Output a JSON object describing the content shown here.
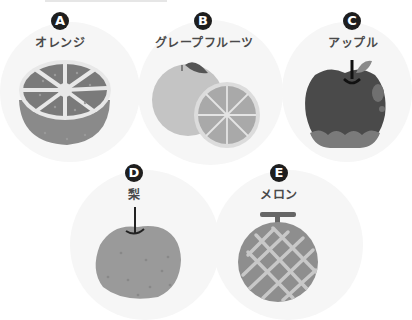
{
  "items": [
    {
      "letter": "A",
      "label": "オレンジ",
      "name": "orange"
    },
    {
      "letter": "B",
      "label": "グレープフルーツ",
      "name": "grapefruit"
    },
    {
      "letter": "C",
      "label": "アップル",
      "name": "apple"
    },
    {
      "letter": "D",
      "label": "梨",
      "name": "pear"
    },
    {
      "letter": "E",
      "label": "メロン",
      "name": "melon"
    }
  ],
  "colors": {
    "badge": "#1e1e1e",
    "label": "#4a4a4a",
    "background_circle": "#f6f6f6",
    "orange_flesh": "#7a7a7a",
    "orange_rind": "#8a8a8a",
    "grapefruit_body": "#c4c4c4",
    "grapefruit_slice": "#a9a9a9",
    "apple_body": "#4a4a4a",
    "pear_body": "#9a9a9a",
    "melon_body": "#8e8e8e"
  }
}
